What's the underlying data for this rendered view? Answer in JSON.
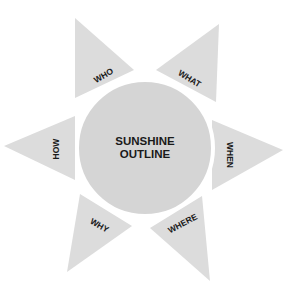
{
  "diagram": {
    "title": "Sunshine Outline",
    "center": {
      "line1": "SUNSHINE",
      "line2": "OUTLINE"
    },
    "rays": [
      {
        "label": "WHO"
      },
      {
        "label": "WHAT"
      },
      {
        "label": "WHEN"
      },
      {
        "label": "WHERE"
      },
      {
        "label": "WHY"
      },
      {
        "label": "HOW"
      }
    ],
    "colors": {
      "ray": "#dcdcdc",
      "sun": "#d5d5d5",
      "text": "#1a1a1a"
    }
  }
}
